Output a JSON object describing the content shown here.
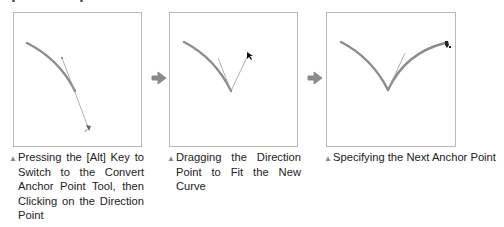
{
  "figure": {
    "colors": {
      "panel_border": "#b8b8b8",
      "curve": "#8c8c8c",
      "direction_line": "#9a9a9a",
      "arrow": "#8a8a8a",
      "marker": "#8a8a8a",
      "text": "#222222"
    },
    "panels": [
      {
        "id": "step-1",
        "cursor_icon": "convert-anchor-point-cursor",
        "caption_marker": "▲",
        "caption": "Pressing the [Alt] Key to Switch to the Convert Anchor Point Tool, then Clicking on the Direction Point"
      },
      {
        "id": "step-2",
        "cursor_icon": "arrow-pointer-cursor",
        "caption_marker": "▲",
        "caption": "Dragging the Direction Point to Fit the New Curve"
      },
      {
        "id": "step-3",
        "cursor_icon": "pen-tool-cursor",
        "caption_marker": "▲",
        "caption": "Specifying the Next Anchor Point"
      }
    ],
    "step_arrows": [
      {
        "icon": "right-arrow-icon"
      },
      {
        "icon": "right-arrow-icon"
      }
    ]
  }
}
